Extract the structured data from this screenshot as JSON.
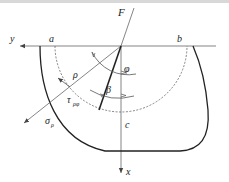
{
  "diagram": {
    "top_partial_text": "",
    "labels": {
      "force": "F",
      "y_axis": "y",
      "x_axis": "x",
      "point_a": "a",
      "point_b": "b",
      "point_c": "c",
      "radius": "ρ",
      "angle_phi": "φ",
      "angle_beta": "β",
      "shear_stress": "τ",
      "shear_stress_sub": "ρφ",
      "normal_stress": "σ",
      "normal_stress_sub": "ρ"
    },
    "colors": {
      "axis": "#555555",
      "contour": "#222222",
      "dashed": "#666666"
    }
  }
}
